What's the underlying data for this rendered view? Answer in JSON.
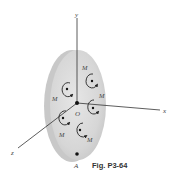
{
  "figure": {
    "caption": "Fig. P3-64",
    "axes": {
      "x_label": "x",
      "y_label": "y",
      "z_label": "z"
    },
    "origin_label": "O",
    "point_label": "A",
    "couples": [
      {
        "label": "M",
        "position": "upper-left"
      },
      {
        "label": "M",
        "position": "upper-right"
      },
      {
        "label": "M",
        "position": "right"
      },
      {
        "label": "M",
        "position": "lower-left"
      },
      {
        "label": "M",
        "position": "bottom"
      }
    ],
    "colors": {
      "disk_face": "#d9d9d9",
      "disk_rim": "#bdbdbd",
      "lines": "#333333",
      "background": "#ffffff"
    }
  }
}
